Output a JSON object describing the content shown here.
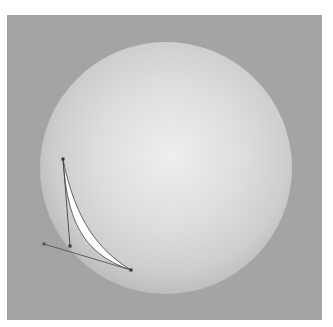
{
  "caption": "",
  "canvas": {
    "background": "#a4a4a4",
    "sphere": {
      "cx": 159,
      "cy": 153,
      "r": 126,
      "highlight": "#efefef",
      "mid": "#d8d8d8",
      "edge": "#bdbdbd"
    },
    "path": {
      "anchors": [
        [
          56,
          144
        ],
        [
          124,
          255
        ]
      ],
      "handles": [
        [
          [
            56,
            144
          ],
          [
            63,
            231
          ]
        ],
        [
          [
            37,
            229
          ],
          [
            124,
            255
          ]
        ]
      ],
      "fill": "#ffffff",
      "stroke": "#444444"
    }
  }
}
